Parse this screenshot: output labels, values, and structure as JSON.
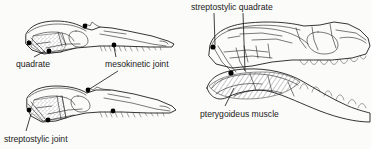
{
  "figure": {
    "type": "scientific-line-diagram",
    "background_color": "#fbfbf9",
    "ink_color": "#111111"
  },
  "labels": {
    "quadrate": "quadrate",
    "mesokinetic_joint": "mesokinetic joint",
    "streptostylic_joint": "streptostylic joint",
    "streptostylic_quadrate": "streptostylic quadrate",
    "pterygoideus_muscle": "pterygoideus muscle"
  },
  "panels": [
    {
      "id": "upper-left-skull",
      "description": "lizard skull, jaw closed, stippled adductor chamber",
      "labels": [
        "quadrate",
        "mesokinetic joint"
      ]
    },
    {
      "id": "lower-left-skull",
      "description": "lizard skull, jaw depressed, stippled adductor chamber",
      "labels": [
        "streptostylic joint",
        "mesokinetic joint"
      ]
    },
    {
      "id": "right-skull",
      "description": "large snake skull with gape open and hatched pterygoideus muscle",
      "labels": [
        "streptostylic quadrate",
        "pterygoideus muscle"
      ]
    }
  ],
  "joint_markers": {
    "count": 9,
    "color": "#000000",
    "meaning": "black dots mark kinetic joints"
  },
  "textures": {
    "stipple": "dotted fill marking temporal adductor chamber",
    "hatch": "diagonal line fill marking pterygoideus muscle"
  }
}
